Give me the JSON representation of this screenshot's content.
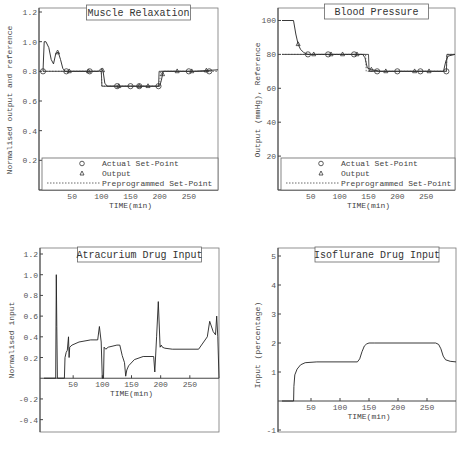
{
  "chart_data": [
    {
      "type": "line",
      "title": "Muscle Relaxation",
      "xlabel": "TIME(min)",
      "ylabel": "Normalised output and reference",
      "xlim": [
        0,
        300
      ],
      "ylim": [
        0,
        1.2
      ],
      "xticks": [
        50,
        100,
        150,
        200,
        250
      ],
      "yticks": [
        0.2,
        0.4,
        0.6,
        0.8,
        1.0,
        1.2
      ],
      "ytick_labels": [
        "0.2",
        "0.4",
        "0.6",
        "0.8",
        "1.0",
        "1.2"
      ],
      "legend": [
        "Actual Set-Point",
        "Output",
        "Preprogrammed Set-Point"
      ],
      "legend_position": "bottom-inside",
      "series": [
        {
          "name": "Output",
          "x": [
            0,
            2,
            5,
            10,
            14,
            18,
            22,
            26,
            30,
            34,
            38,
            42,
            60,
            80,
            95,
            100,
            103,
            106,
            110,
            120,
            150,
            180,
            200,
            203,
            206,
            210,
            230,
            260,
            300
          ],
          "y": [
            0.8,
            1.0,
            1.0,
            0.96,
            0.88,
            0.85,
            0.92,
            0.93,
            0.88,
            0.82,
            0.8,
            0.8,
            0.8,
            0.8,
            0.8,
            0.82,
            0.8,
            0.72,
            0.7,
            0.7,
            0.7,
            0.7,
            0.7,
            0.74,
            0.8,
            0.8,
            0.8,
            0.8,
            0.81
          ]
        },
        {
          "name": "Actual Set-Point",
          "x": [
            0,
            40,
            80,
            100,
            101,
            125,
            150,
            165,
            198,
            199,
            230,
            250,
            285
          ],
          "y": [
            0.8,
            0.8,
            0.8,
            0.8,
            0.7,
            0.7,
            0.7,
            0.7,
            0.7,
            0.8,
            0.8,
            0.8,
            0.8
          ]
        },
        {
          "name": "Preprogrammed Set-Point",
          "x": [
            0,
            100,
            101,
            200,
            201,
            300
          ],
          "y": [
            0.8,
            0.8,
            0.7,
            0.7,
            0.8,
            0.8
          ]
        }
      ],
      "markers": {
        "circles_x": [
          0,
          40,
          80,
          127,
          150,
          165,
          198,
          250,
          285
        ],
        "triangles_x": [
          25,
          45,
          78,
          102,
          130,
          165,
          180,
          205,
          230,
          255,
          280
        ]
      }
    },
    {
      "type": "line",
      "title": "Blood Pressure",
      "xlabel": "TIME(min)",
      "ylabel": "Output (mmHg), Reference",
      "xlim": [
        0,
        300
      ],
      "ylim": [
        0,
        105
      ],
      "xticks": [
        50,
        100,
        150,
        200,
        250
      ],
      "yticks": [
        20,
        40,
        60,
        80,
        100
      ],
      "legend": [
        "Actual Set-Point",
        "Output",
        "Preprogrammed Set-Point"
      ],
      "legend_position": "bottom-inside",
      "series": [
        {
          "name": "Output",
          "x": [
            0,
            20,
            24,
            28,
            32,
            38,
            45,
            60,
            100,
            140,
            144,
            148,
            155,
            170,
            200,
            280,
            284,
            288,
            300
          ],
          "y": [
            100,
            100,
            92,
            86,
            83,
            81,
            80,
            80,
            80,
            80,
            78,
            72,
            71,
            70,
            70,
            70,
            76,
            79,
            80
          ]
        },
        {
          "name": "Actual Set-Point",
          "x": [
            0,
            45,
            80,
            125,
            150,
            151,
            165,
            200,
            250,
            285,
            286,
            300
          ],
          "y": [
            80,
            80,
            80,
            80,
            80,
            70,
            70,
            70,
            70,
            70,
            80,
            80
          ]
        },
        {
          "name": "Preprogrammed Set-Point",
          "x": [
            0,
            145,
            146,
            285,
            286,
            300
          ],
          "y": [
            80,
            80,
            70,
            70,
            80,
            80
          ]
        }
      ],
      "markers": {
        "circles_x": [
          45,
          80,
          125,
          165,
          200,
          240,
          285
        ],
        "triangles_x": [
          28,
          55,
          85,
          105,
          130,
          155,
          180,
          230,
          255
        ]
      }
    },
    {
      "type": "line",
      "title": "Atracurium Drug Input",
      "xlabel": "TIME(min)",
      "ylabel": "Normalised input",
      "xlim": [
        0,
        300
      ],
      "ylim": [
        -0.5,
        1.2
      ],
      "xticks": [
        50,
        100,
        150,
        200,
        250
      ],
      "yticks": [
        -0.4,
        -0.2,
        0.2,
        0.4,
        0.6,
        0.8,
        1.0,
        1.2
      ],
      "ytick_labels": [
        "-0.4",
        "-0.2",
        "0.2",
        "0.4",
        "0.6",
        "0.8",
        "1.0",
        "1.2"
      ],
      "series": [
        {
          "name": "Atracurium input",
          "x": [
            0,
            20,
            21,
            22,
            23,
            35,
            36,
            38,
            40,
            42,
            43,
            44,
            48,
            60,
            80,
            92,
            95,
            98,
            100,
            102,
            103,
            106,
            110,
            125,
            130,
            134,
            138,
            140,
            142,
            145,
            155,
            170,
            188,
            190,
            193,
            196,
            199,
            201,
            203,
            207,
            220,
            240,
            265,
            280,
            284,
            290,
            294,
            296,
            298,
            300
          ],
          "y": [
            0,
            0,
            1.0,
            0.5,
            0,
            0,
            0.2,
            0.25,
            0.27,
            0.4,
            0.2,
            0.3,
            0.32,
            0.35,
            0.37,
            0.37,
            0.5,
            0.35,
            0,
            0,
            0.3,
            0.28,
            0.3,
            0.32,
            0.32,
            0.22,
            0.15,
            0.02,
            0.08,
            0.12,
            0.18,
            0.21,
            0.21,
            0.06,
            0.4,
            0.74,
            0.3,
            0.32,
            0.3,
            0.29,
            0.28,
            0.28,
            0.28,
            0.4,
            0.55,
            0.45,
            0.42,
            0.6,
            0.4,
            0
          ]
        }
      ]
    },
    {
      "type": "line",
      "title": "Isoflurane Drug Input",
      "xlabel": "TIME(min)",
      "ylabel": "Input (percentage)",
      "xlim": [
        0,
        300
      ],
      "ylim": [
        -1,
        5
      ],
      "xticks": [
        50,
        100,
        150,
        200,
        250
      ],
      "yticks": [
        -1,
        1,
        2,
        3,
        4,
        5
      ],
      "series": [
        {
          "name": "Isoflurane input",
          "x": [
            0,
            20,
            20.5,
            22,
            26,
            32,
            40,
            60,
            100,
            130,
            134,
            138,
            142,
            146,
            150,
            160,
            200,
            265,
            270,
            274,
            278,
            282,
            290,
            300
          ],
          "y": [
            0,
            0,
            0.5,
            0.9,
            1.1,
            1.25,
            1.32,
            1.35,
            1.35,
            1.35,
            1.45,
            1.7,
            1.9,
            1.97,
            2.0,
            2.0,
            2.0,
            2.0,
            1.95,
            1.8,
            1.55,
            1.42,
            1.37,
            1.35
          ]
        }
      ]
    }
  ],
  "panels": [
    {
      "title": "Muscle Relaxation",
      "ylabel": "Normalised output and reference",
      "xlabel": "TIME(min)"
    },
    {
      "title": "Blood Pressure",
      "ylabel": "Output (mmHg), Reference",
      "xlabel": "TIME(min)"
    },
    {
      "title": "Atracurium Drug Input",
      "ylabel": "Normalised input",
      "xlabel": "TIME(min)"
    },
    {
      "title": "Isoflurane Drug Input",
      "ylabel": "Input (percentage)",
      "xlabel": "TIME(min)"
    }
  ],
  "legend": {
    "actual": "Actual Set-Point",
    "output": "Output",
    "preprogrammed": "Preprogrammed Set-Point"
  }
}
